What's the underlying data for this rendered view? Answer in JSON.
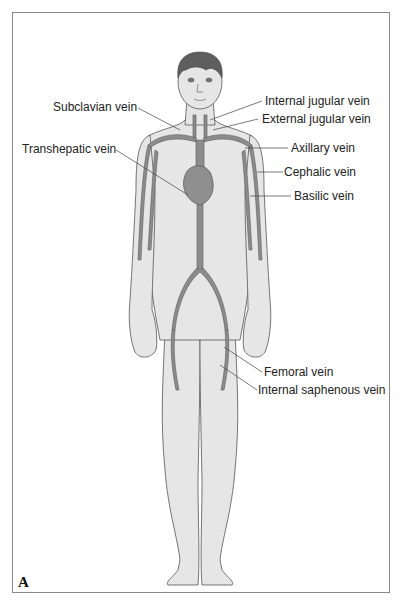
{
  "figure": {
    "panel_letter": "A",
    "labels": {
      "subclavian": "Subclavian vein",
      "internal_jugular": "Internal jugular vein",
      "external_jugular": "External jugular vein",
      "transhepatic": "Transhepatic vein",
      "axillary": "Axillary vein",
      "cephalic": "Cephalic vein",
      "basilic": "Basilic vein",
      "femoral": "Femoral vein",
      "internal_saphenous": "Internal saphenous vein"
    },
    "colors": {
      "skin": "#e6e6e6",
      "outline": "#555555",
      "vein": "#8c8c8c",
      "vein_outline": "#5a5a5a",
      "heart": "#8f8f8f",
      "hair": "#5e5e5e",
      "leader_line": "#444444",
      "frame": "#8a8a8a"
    }
  }
}
